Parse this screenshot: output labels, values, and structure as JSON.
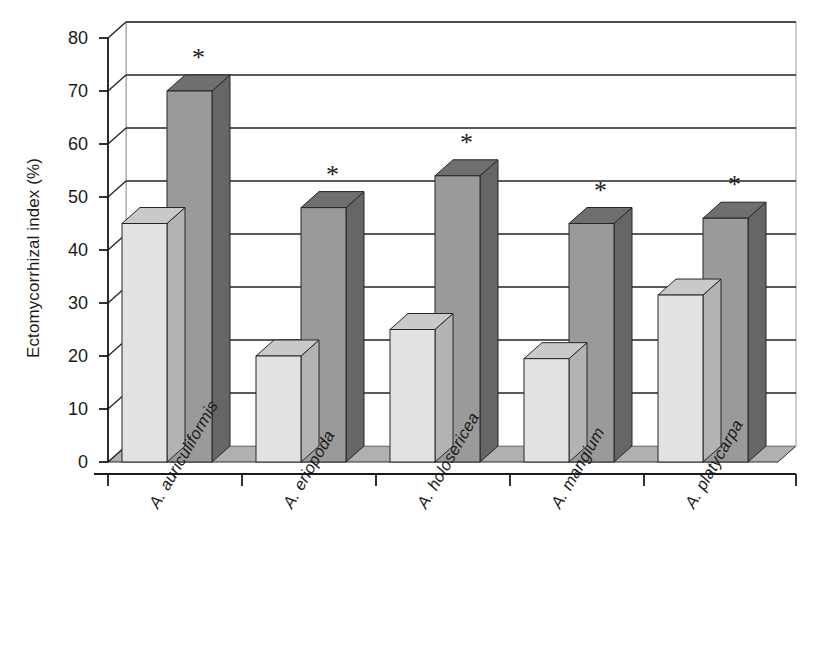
{
  "chart_data": {
    "type": "bar",
    "title": "",
    "subtitle": "",
    "xlabel": "",
    "ylabel": "Ectomycorrhizal index (%)",
    "ylim": [
      0,
      80
    ],
    "ytick_step": 10,
    "yticks": [
      "0",
      "10",
      "20",
      "30",
      "40",
      "50",
      "60",
      "70",
      "80"
    ],
    "grid": true,
    "legend": "none",
    "style": "3d-grouped-bars",
    "categories": [
      "A. auriculiformis",
      "A. eriopoda",
      "A. holosericea",
      "A. mangium",
      "A. platycarpa"
    ],
    "series": [
      {
        "name": "light-series",
        "color": "#e2e2e2",
        "top_color": "#c9c9c9",
        "side_color": "#b3b3b3",
        "values": [
          45,
          20,
          25,
          19.5,
          31.5
        ]
      },
      {
        "name": "dark-series",
        "color": "#9a9a9a",
        "top_color": "#6f6f6f",
        "side_color": "#666666",
        "values": [
          70,
          48,
          54,
          45,
          46
        ]
      }
    ],
    "annotations": [
      {
        "label": "*",
        "category": "A. auriculiformis",
        "series": "dark-series"
      },
      {
        "label": "*",
        "category": "A. eriopoda",
        "series": "dark-series"
      },
      {
        "label": "*",
        "category": "A. holosericea",
        "series": "dark-series"
      },
      {
        "label": "*",
        "category": "A. mangium",
        "series": "dark-series"
      },
      {
        "label": "*",
        "category": "A. platycarpa",
        "series": "dark-series"
      }
    ],
    "annotation_symbol": "*",
    "floor_color": "#b0b0b0",
    "axis_color": "#1a1a1a",
    "background": "#ffffff"
  }
}
